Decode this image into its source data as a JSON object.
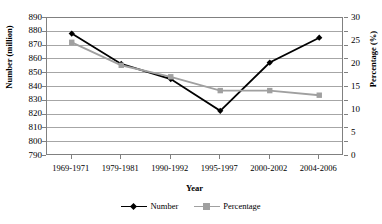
{
  "chart_data": {
    "type": "line",
    "title": "",
    "xlabel": "Year",
    "ylabel": "Number (million)",
    "y2label": "Percentage (%)",
    "categories": [
      "1969-1971",
      "1979-1981",
      "1990-1992",
      "1995-1997",
      "2000-2002",
      "2004-2006"
    ],
    "series": [
      {
        "name": "Number",
        "axis": "left",
        "color": "#000000",
        "marker": "diamond",
        "values": [
          878,
          856,
          845,
          822,
          857,
          875
        ]
      },
      {
        "name": "Percentage",
        "axis": "right",
        "color": "#a0a0a0",
        "marker": "square",
        "values": [
          24.5,
          19.5,
          17.0,
          14.0,
          14.0,
          13.0
        ]
      }
    ],
    "ylim": [
      790,
      890
    ],
    "yticks": [
      790,
      800,
      810,
      820,
      830,
      840,
      850,
      860,
      870,
      880,
      890
    ],
    "y2lim": [
      0,
      30
    ],
    "y2ticks": [
      0,
      5,
      10,
      15,
      20,
      25,
      30
    ],
    "grid": true,
    "legend_position": "bottom"
  },
  "axes": {
    "left_title": "Number (million)",
    "right_title": "Percentage (%)",
    "x_title": "Year"
  },
  "legend": {
    "items": [
      {
        "label": "Number"
      },
      {
        "label": "Percentage"
      }
    ]
  },
  "colors": {
    "series_number": "#000000",
    "series_percentage": "#a0a0a0",
    "gridline": "#a6a6a6",
    "axis": "#808080",
    "background": "#ffffff"
  }
}
